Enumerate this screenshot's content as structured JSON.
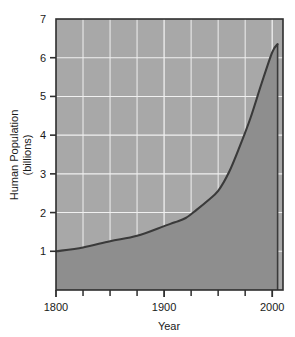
{
  "chart_data": {
    "type": "area",
    "title": "",
    "xlabel": "Year",
    "ylabel": "Human Population\n(billions)",
    "ylabel_line1": "Human Population",
    "ylabel_line2": "(billions)",
    "xlim": [
      1800,
      2010
    ],
    "ylim": [
      0,
      7
    ],
    "xticks": [
      1800,
      1900,
      2000
    ],
    "xtick_labels": [
      "1800",
      "1900",
      "2000"
    ],
    "xminor_ticks": [
      1825,
      1850,
      1875,
      1925,
      1950,
      1975
    ],
    "yticks": [
      1,
      2,
      3,
      4,
      5,
      6,
      7
    ],
    "ytick_labels": [
      "1",
      "2",
      "3",
      "4",
      "5",
      "6",
      "7"
    ],
    "grid": true,
    "grid_color": "#f0f0f0",
    "legend": "none",
    "series": [
      {
        "name": "Human Population (billions)",
        "line_color": "#3a3a3a",
        "fill_color": "#8e8e8e",
        "x": [
          1800,
          1825,
          1850,
          1875,
          1900,
          1910,
          1920,
          1930,
          1940,
          1950,
          1960,
          1970,
          1980,
          1990,
          2000,
          2005
        ],
        "values": [
          1.0,
          1.1,
          1.26,
          1.4,
          1.65,
          1.75,
          1.86,
          2.07,
          2.3,
          2.56,
          3.04,
          3.71,
          4.45,
          5.32,
          6.14,
          6.35
        ]
      }
    ],
    "plot_bg_color": "#a8a8a8",
    "plot_border_color": "#2e2e2e",
    "peak_value": "6.35",
    "start_value": "1.0"
  },
  "axes": {
    "x_axis_label": "Year",
    "y_axis_label_line1": "Human Population",
    "y_axis_label_line2": "(billions)"
  }
}
